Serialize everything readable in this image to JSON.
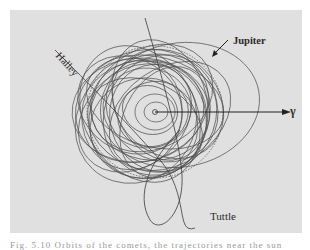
{
  "figure": {
    "background_color": "#e0e0e0",
    "line_color": "#3a3a3a",
    "labels": {
      "halley": "Halley",
      "jupiter": "Jupiter",
      "tuttle": "Tuttle",
      "vernal_equinox": "γ"
    },
    "caption_truncated": "Fig. 5.10 Orbits of the comets, the trajectories near the sun for..."
  }
}
